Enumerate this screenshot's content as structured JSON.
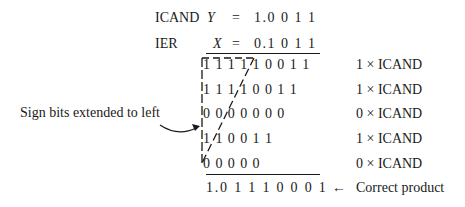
{
  "multiplicand": {
    "label": "ICAND",
    "var": "Y",
    "eq": "=",
    "value": "1.0 0 1 1"
  },
  "multiplier": {
    "label": "IER",
    "var": "X",
    "eq": "=",
    "value": "0.1 0 1 1"
  },
  "partial_products": [
    {
      "bits": [
        "1",
        "1",
        "1",
        "1",
        "1",
        "0",
        "0",
        "1",
        "1"
      ],
      "note": "1 × ICAND"
    },
    {
      "bits": [
        "1",
        "1",
        "1",
        "1",
        "0",
        "0",
        "1",
        "1"
      ],
      "note": "1 × ICAND"
    },
    {
      "bits": [
        "0",
        "0",
        "0",
        "0",
        "0",
        "0",
        "0"
      ],
      "note": "0 × ICAND"
    },
    {
      "bits": [
        "1",
        "1",
        "0",
        "0",
        "1",
        "1"
      ],
      "note": "1 × ICAND"
    },
    {
      "bits": [
        "0",
        "0",
        "0",
        "0",
        "0"
      ],
      "note": "0 × ICAND"
    }
  ],
  "product": {
    "value": "1.0 1 1 1 0 0 0 1",
    "arrow": "←",
    "note": "Correct product"
  },
  "annotation": {
    "text": "Sign bits extended to left"
  },
  "colors": {
    "ink": "#1a1a1a",
    "background": "#ffffff"
  }
}
